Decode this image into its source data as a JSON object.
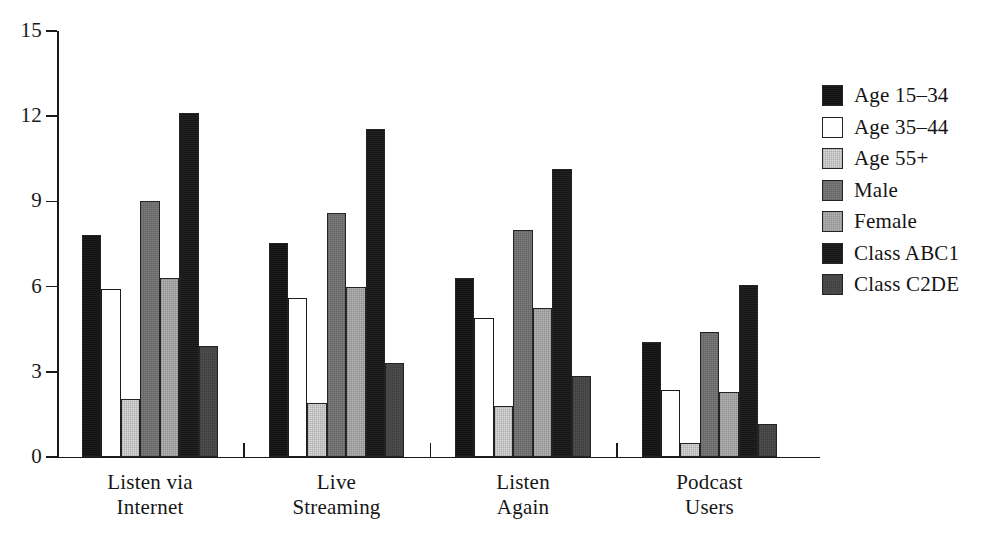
{
  "chart_data": {
    "type": "bar",
    "title": "",
    "subtitle": "",
    "xlabel": "",
    "ylabel": "",
    "ylim": [
      0,
      15
    ],
    "yticks": [
      0,
      3,
      6,
      9,
      12,
      15
    ],
    "ytick_labels": [
      "0",
      "3",
      "6",
      "9",
      "12",
      "15"
    ],
    "grid": false,
    "legend_position": "right",
    "categories": [
      "Listen via Internet",
      "Live Streaming",
      "Listen Again",
      "Podcast Users"
    ],
    "category_lines": [
      [
        "Listen via",
        "Internet"
      ],
      [
        "Live",
        "Streaming"
      ],
      [
        "Listen",
        "Again"
      ],
      [
        "Podcast",
        "Users"
      ]
    ],
    "series": [
      {
        "name": "Age 15–34",
        "color": "#111111",
        "values": [
          7.8,
          7.55,
          6.3,
          4.05
        ]
      },
      {
        "name": "Age 35–44",
        "color": "#ffffff",
        "values": [
          5.9,
          5.6,
          4.9,
          2.35
        ]
      },
      {
        "name": "Age 55+",
        "color": "#d9d9d9",
        "values": [
          2.05,
          1.9,
          1.8,
          0.5
        ]
      },
      {
        "name": "Male",
        "color": "#7d7d7d",
        "values": [
          9.0,
          8.6,
          8.0,
          4.4
        ]
      },
      {
        "name": "Female",
        "color": "#b4b4b4",
        "values": [
          6.3,
          6.0,
          5.25,
          2.3
        ]
      },
      {
        "name": "Class ABC1",
        "color": "#161616",
        "values": [
          12.1,
          11.55,
          10.15,
          6.05
        ]
      },
      {
        "name": "Class C2DE",
        "color": "#4f4f4f",
        "values": [
          3.9,
          3.3,
          2.85,
          1.15
        ]
      }
    ]
  },
  "legend": {
    "items": [
      {
        "label": "Age 15–34"
      },
      {
        "label": "Age 35–44"
      },
      {
        "label": "Age 55+"
      },
      {
        "label": "Male"
      },
      {
        "label": "Female"
      },
      {
        "label": "Class ABC1"
      },
      {
        "label": "Class C2DE"
      }
    ]
  }
}
